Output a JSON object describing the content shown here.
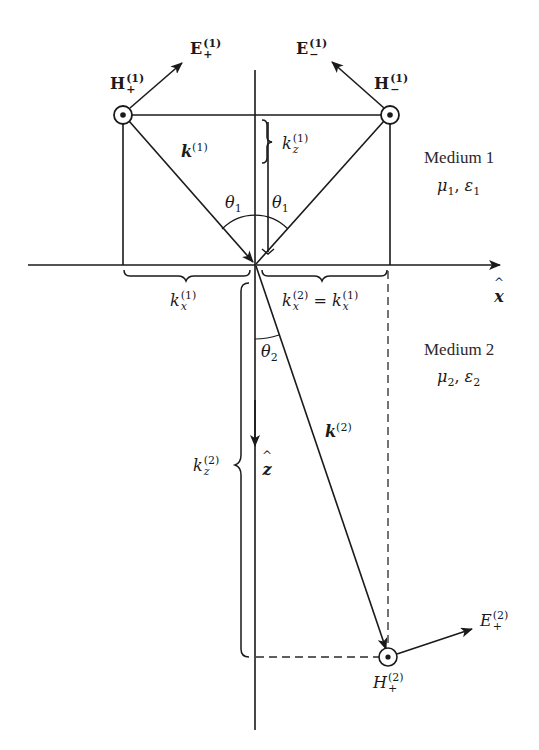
{
  "diagram": {
    "colors": {
      "ink": "#1a1a1a",
      "dashed": "#2a2a2a",
      "background": "#ffffff"
    },
    "media": [
      {
        "name": "Medium 1",
        "params": "μ1, ε1",
        "params_mu": "μ",
        "params_mu_sub": "1",
        "params_eps": "ε",
        "params_eps_sub": "1"
      },
      {
        "name": "Medium 2",
        "params": "μ2, ε2",
        "params_mu": "μ",
        "params_mu_sub": "2",
        "params_eps": "ε",
        "params_eps_sub": "2"
      }
    ],
    "axes": {
      "x": {
        "label": "x",
        "hat": "^"
      },
      "z": {
        "label": "z",
        "hat": "^"
      }
    },
    "vectors": {
      "k1": {
        "base": "k",
        "sup": "(1)"
      },
      "k2": {
        "base": "k",
        "sup": "(2)"
      },
      "E_plus_1": {
        "base": "E",
        "sub": "+",
        "sup": "(1)"
      },
      "E_minus_1": {
        "base": "E",
        "sub": "−",
        "sup": "(1)"
      },
      "H_plus_1": {
        "base": "H",
        "sub": "+",
        "sup": "(1)"
      },
      "H_minus_1": {
        "base": "H",
        "sub": "−",
        "sup": "(1)"
      },
      "E_plus_2": {
        "base": "E",
        "sub": "+",
        "sup": "(2)"
      },
      "H_plus_2": {
        "base": "H",
        "sub": "+",
        "sup": "(2)"
      }
    },
    "components": {
      "kz1": {
        "base": "k",
        "sub": "z",
        "sup": "(1)"
      },
      "kx1": {
        "base": "k",
        "sub": "x",
        "sup": "(1)"
      },
      "kx2_eq": {
        "left_base": "k",
        "left_sub": "x",
        "left_sup": "(2)",
        "equals": "=",
        "right_base": "k",
        "right_sub": "x",
        "right_sup": "(1)"
      },
      "kz2": {
        "base": "k",
        "sub": "z",
        "sup": "(2)"
      }
    },
    "angles": {
      "theta1_incident": {
        "base": "θ",
        "sub": "1"
      },
      "theta1_reflected": {
        "base": "θ",
        "sub": "1"
      },
      "theta2": {
        "base": "θ",
        "sub": "2"
      }
    },
    "icons": {
      "field_out_of_page": "circle-dot-icon"
    }
  }
}
